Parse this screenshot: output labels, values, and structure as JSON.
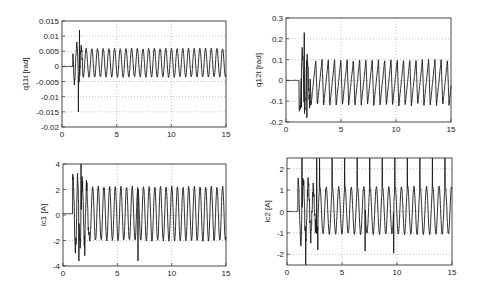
{
  "figure": {
    "width": 478,
    "height": 291,
    "background": "#ffffff",
    "line_color": "#1a1a1a",
    "grid_color": "#9a9a9a",
    "axes_color": "#333333"
  },
  "chart_data": [
    {
      "id": "q11t",
      "type": "line",
      "title": "",
      "xlabel": "",
      "ylabel": "q11t [rad]",
      "xlim": [
        0,
        15
      ],
      "ylim": [
        -0.02,
        0.015
      ],
      "xticks": [
        0,
        5,
        10,
        15
      ],
      "xtick_labels": [
        "0",
        "5",
        "10",
        "15"
      ],
      "yticks": [
        -0.02,
        -0.015,
        -0.01,
        -0.005,
        0,
        0.005,
        0.01,
        0.015
      ],
      "ytick_labels": [
        "-0.02",
        "-0.015",
        "-0.01",
        "-0.005",
        "0",
        "0.005",
        "0.01",
        "0.015"
      ],
      "grid": true,
      "box": {
        "left": 62,
        "top": 21,
        "right": 226,
        "bottom": 127
      },
      "signal": {
        "flat_until": 1.0,
        "flat_value": 0.0,
        "transient_start": 1.0,
        "steady_start": 1.9,
        "period": 0.52,
        "center": 0.0012,
        "amplitude": 0.0047,
        "spikes": [
          {
            "x": 1.6,
            "y": 0.012
          },
          {
            "x": 1.5,
            "y": -0.015
          }
        ],
        "description": "Flat near 0 until ~1.2 s, a dip to -0.002, sharp spike to 0.012 and -0.015 near 1.5 s, then steady sinusoid between about -0.0035 and 0.006"
      }
    },
    {
      "id": "q12t",
      "type": "line",
      "title": "",
      "xlabel": "",
      "ylabel": "q12t [rad]",
      "xlim": [
        0,
        15
      ],
      "ylim": [
        -0.2,
        0.3
      ],
      "xticks": [
        0,
        5,
        10,
        15
      ],
      "xtick_labels": [
        "0",
        "5",
        "10",
        "15"
      ],
      "yticks": [
        -0.2,
        -0.1,
        0,
        0.1,
        0.2,
        0.3
      ],
      "ytick_labels": [
        "-0.2",
        "-0.1",
        "0",
        "0.1",
        "0.2",
        "0.3"
      ],
      "grid": true,
      "box": {
        "left": 286,
        "top": 18,
        "right": 451,
        "bottom": 122
      },
      "signal": {
        "flat_until": 1.2,
        "flat_value": 0.0,
        "steady_start": 2.2,
        "period": 0.57,
        "center": -0.01,
        "amplitude": 0.11,
        "spikes": [
          {
            "x": 1.65,
            "y": 0.23
          },
          {
            "x": 1.9,
            "y": -0.18
          },
          {
            "x": 1.4,
            "y": -0.13
          }
        ],
        "description": "Flat ~0 with small bump to 0.02 before 1.2 s, spike to 0.23 at ~1.65 s, trough -0.18 at ~1.9 s, then sawtooth-like oscillation between about -0.12 and 0.10"
      }
    },
    {
      "id": "ic1",
      "type": "line",
      "title": "",
      "xlabel": "",
      "ylabel": "Ic1 [A]",
      "xlim": [
        0,
        15
      ],
      "ylim": [
        -4,
        4
      ],
      "xticks": [
        0,
        5,
        10,
        15
      ],
      "xtick_labels": [
        "0",
        "5",
        "10",
        "15"
      ],
      "yticks": [
        -4,
        -2,
        0,
        2,
        4
      ],
      "ytick_labels": [
        "-4",
        "-2",
        "0",
        "2",
        "4"
      ],
      "grid": true,
      "box": {
        "left": 63,
        "top": 164,
        "right": 226,
        "bottom": 266
      },
      "signal": {
        "flat_until": 0.9,
        "flat_value": 0.1,
        "steady_start": 2.4,
        "period": 0.52,
        "center": 0.1,
        "amplitude": 2.1,
        "spikes": [
          {
            "x": 1.65,
            "y": 4.0
          },
          {
            "x": 1.45,
            "y": -3.6
          },
          {
            "x": 2.0,
            "y": -3.2
          },
          {
            "x": 6.9,
            "y": -3.6
          }
        ],
        "description": "Near 0.1 until ~1 s, rises to 1 then large transient between -3.6 and 4 around 1.5 s, then steady oscillation between -2 and 2.2; isolated negative spike to -3.6 near 6.9 s"
      }
    },
    {
      "id": "ic2",
      "type": "line",
      "title": "",
      "xlabel": "",
      "ylabel": "Ic2 [A]",
      "xlim": [
        0,
        15
      ],
      "ylim": [
        -2.5,
        2.5
      ],
      "xticks": [
        0,
        5,
        10,
        15
      ],
      "xtick_labels": [
        "0",
        "5",
        "10",
        "15"
      ],
      "yticks": [
        -2,
        -1,
        0,
        1,
        2
      ],
      "ytick_labels": [
        "-2",
        "-1",
        "0",
        "1",
        "2"
      ],
      "grid": true,
      "box": {
        "left": 287,
        "top": 158,
        "right": 452,
        "bottom": 265
      },
      "signal": {
        "flat_until": 1.0,
        "flat_value": 0.0,
        "steady_start": 2.6,
        "period": 0.57,
        "center": 0.05,
        "amplitude": 1.1,
        "spikes": [
          {
            "x": 1.35,
            "y": 2.5
          },
          {
            "x": 1.7,
            "y": -2.5
          },
          {
            "x": 2.7,
            "y": 2.5
          },
          {
            "x": 2.8,
            "y": -1.8
          },
          {
            "x": 7.1,
            "y": -1.85
          },
          {
            "x": 9.7,
            "y": -1.95
          }
        ],
        "clipped_upper_spikes_every_period": true,
        "description": "Flat 0 until ~1 s, dips to -0.7, large transient clipped at +/-2.5, then oscillation between about -1.1 and 1.2 with sharp spikes clipped at the top (2.5) once per period"
      }
    }
  ]
}
